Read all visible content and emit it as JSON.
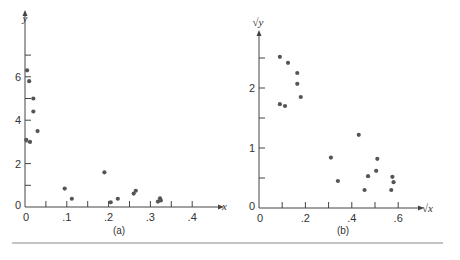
{
  "chart_data": [
    {
      "type": "scatter",
      "panel_label": "(a)",
      "xlabel": "x",
      "ylabel": "y",
      "xlim": [
        0,
        0.45
      ],
      "ylim": [
        0,
        7.2
      ],
      "x_ticks": [
        0,
        0.05,
        0.1,
        0.15,
        0.2,
        0.25,
        0.3,
        0.35,
        0.4
      ],
      "x_tick_labels": [
        {
          "v": 0,
          "t": "0"
        },
        {
          "v": 0.1,
          "t": ".1"
        },
        {
          "v": 0.2,
          "t": ".2"
        },
        {
          "v": 0.3,
          "t": ".3"
        },
        {
          "v": 0.4,
          "t": ".4"
        }
      ],
      "y_ticks": [
        0,
        1,
        2,
        3,
        4,
        5,
        6,
        7
      ],
      "y_tick_labels": [
        {
          "v": 0,
          "t": "0"
        },
        {
          "v": 2,
          "t": "2"
        },
        {
          "v": 4,
          "t": "4"
        },
        {
          "v": 6,
          "t": "6"
        }
      ],
      "points": [
        {
          "x": 0.005,
          "y": 6.3
        },
        {
          "x": 0.01,
          "y": 5.8
        },
        {
          "x": 0.02,
          "y": 5.0
        },
        {
          "x": 0.02,
          "y": 4.4
        },
        {
          "x": 0.03,
          "y": 3.5
        },
        {
          "x": 0.003,
          "y": 3.1
        },
        {
          "x": 0.012,
          "y": 3.0
        },
        {
          "x": 0.095,
          "y": 0.85
        },
        {
          "x": 0.112,
          "y": 0.38
        },
        {
          "x": 0.19,
          "y": 1.6
        },
        {
          "x": 0.205,
          "y": 0.22
        },
        {
          "x": 0.222,
          "y": 0.38
        },
        {
          "x": 0.26,
          "y": 0.62
        },
        {
          "x": 0.265,
          "y": 0.75
        },
        {
          "x": 0.318,
          "y": 0.25
        },
        {
          "x": 0.323,
          "y": 0.4
        },
        {
          "x": 0.325,
          "y": 0.3
        }
      ]
    },
    {
      "type": "scatter",
      "panel_label": "(b)",
      "xlabel": "√x",
      "ylabel": "√y",
      "xlim": [
        0,
        0.68
      ],
      "ylim": [
        0,
        2.85
      ],
      "x_ticks": [
        0,
        0.1,
        0.2,
        0.3,
        0.4,
        0.5,
        0.6
      ],
      "x_tick_labels": [
        {
          "v": 0,
          "t": "0"
        },
        {
          "v": 0.2,
          "t": ".2"
        },
        {
          "v": 0.4,
          "t": ".4"
        },
        {
          "v": 0.6,
          "t": ".6"
        }
      ],
      "y_ticks": [
        0,
        0.5,
        1,
        1.5,
        2,
        2.5
      ],
      "y_tick_labels": [
        {
          "v": 0,
          "t": "0"
        },
        {
          "v": 1,
          "t": "1"
        },
        {
          "v": 2,
          "t": "2"
        }
      ],
      "points": [
        {
          "x": 0.09,
          "y": 2.52
        },
        {
          "x": 0.125,
          "y": 2.42
        },
        {
          "x": 0.165,
          "y": 2.25
        },
        {
          "x": 0.165,
          "y": 2.07
        },
        {
          "x": 0.18,
          "y": 1.85
        },
        {
          "x": 0.09,
          "y": 1.73
        },
        {
          "x": 0.112,
          "y": 1.7
        },
        {
          "x": 0.31,
          "y": 0.84
        },
        {
          "x": 0.34,
          "y": 0.45
        },
        {
          "x": 0.43,
          "y": 1.22
        },
        {
          "x": 0.455,
          "y": 0.3
        },
        {
          "x": 0.47,
          "y": 0.53
        },
        {
          "x": 0.505,
          "y": 0.62
        },
        {
          "x": 0.51,
          "y": 0.82
        },
        {
          "x": 0.57,
          "y": 0.3
        },
        {
          "x": 0.575,
          "y": 0.52
        },
        {
          "x": 0.58,
          "y": 0.43
        }
      ]
    }
  ]
}
